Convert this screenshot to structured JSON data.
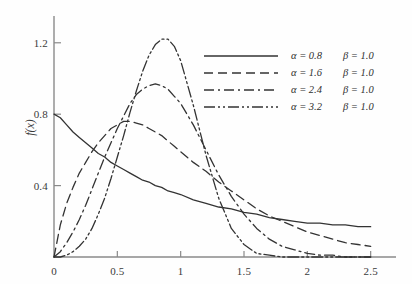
{
  "chart_data": {
    "type": "line",
    "title": "",
    "xlabel": "",
    "ylabel": "f(x)",
    "xlim": [
      0,
      2.7
    ],
    "ylim": [
      0,
      1.35
    ],
    "grid": false,
    "legend_position": "top-right",
    "x_ticks": [
      "0",
      "0.5",
      "1",
      "1.5",
      "2",
      "2.5"
    ],
    "x_tick_values": [
      0,
      0.5,
      1,
      1.5,
      2,
      2.5
    ],
    "y_ticks": [
      "0.4",
      "0.8",
      "1.2"
    ],
    "y_tick_values": [
      0.4,
      0.8,
      1.2
    ],
    "x": [
      0.0,
      0.05,
      0.1,
      0.15,
      0.2,
      0.25,
      0.3,
      0.35,
      0.4,
      0.45,
      0.5,
      0.55,
      0.6,
      0.65,
      0.7,
      0.75,
      0.8,
      0.85,
      0.9,
      0.95,
      1.0,
      1.1,
      1.2,
      1.3,
      1.4,
      1.5,
      1.6,
      1.7,
      1.8,
      1.9,
      2.0,
      2.1,
      2.2,
      2.3,
      2.4,
      2.5
    ],
    "series": [
      {
        "name": "alpha = 0.8, beta = 1.0",
        "alpha": 0.8,
        "beta": 1.0,
        "line_style": "solid",
        "color": "#333333",
        "values": [
          0.8,
          0.78,
          0.74,
          0.7,
          0.67,
          0.64,
          0.61,
          0.58,
          0.56,
          0.53,
          0.51,
          0.49,
          0.47,
          0.45,
          0.43,
          0.42,
          0.4,
          0.39,
          0.37,
          0.36,
          0.35,
          0.32,
          0.3,
          0.28,
          0.27,
          0.25,
          0.24,
          0.22,
          0.21,
          0.2,
          0.19,
          0.19,
          0.18,
          0.18,
          0.17,
          0.17
        ]
      },
      {
        "name": "alpha = 1.6, beta = 1.0",
        "alpha": 1.6,
        "beta": 1.0,
        "line_style": "dashed",
        "color": "#333333",
        "values": [
          0.0,
          0.18,
          0.3,
          0.39,
          0.47,
          0.53,
          0.59,
          0.64,
          0.68,
          0.72,
          0.74,
          0.76,
          0.76,
          0.75,
          0.74,
          0.72,
          0.7,
          0.68,
          0.65,
          0.62,
          0.59,
          0.53,
          0.48,
          0.42,
          0.37,
          0.32,
          0.27,
          0.23,
          0.2,
          0.17,
          0.14,
          0.12,
          0.1,
          0.08,
          0.07,
          0.06
        ]
      },
      {
        "name": "alpha = 2.4, beta = 1.0",
        "alpha": 2.4,
        "beta": 1.0,
        "line_style": "dash-dot",
        "color": "#333333",
        "values": [
          0.0,
          0.03,
          0.08,
          0.14,
          0.21,
          0.29,
          0.38,
          0.47,
          0.56,
          0.64,
          0.72,
          0.79,
          0.86,
          0.91,
          0.94,
          0.96,
          0.97,
          0.96,
          0.94,
          0.9,
          0.86,
          0.74,
          0.6,
          0.46,
          0.34,
          0.24,
          0.16,
          0.1,
          0.06,
          0.04,
          0.02,
          0.01,
          0.01,
          0.0,
          0.0,
          0.0
        ]
      },
      {
        "name": "alpha = 3.2, beta = 1.0",
        "alpha": 3.2,
        "beta": 1.0,
        "line_style": "dash-dot-dot",
        "color": "#333333",
        "values": [
          0.0,
          0.0,
          0.01,
          0.03,
          0.06,
          0.1,
          0.16,
          0.24,
          0.33,
          0.44,
          0.56,
          0.68,
          0.81,
          0.93,
          1.04,
          1.13,
          1.19,
          1.22,
          1.22,
          1.18,
          1.1,
          0.85,
          0.57,
          0.33,
          0.16,
          0.07,
          0.02,
          0.01,
          0.0,
          0.0,
          0.0,
          0.0,
          0.0,
          0.0,
          0.0,
          0.0
        ]
      }
    ],
    "legend_entries": [
      {
        "line_style": "solid",
        "alpha_label": "α = 0.8",
        "beta_label": "β = 1.0"
      },
      {
        "line_style": "dashed",
        "alpha_label": "α = 1.6",
        "beta_label": "β = 1.0"
      },
      {
        "line_style": "dash-dot",
        "alpha_label": "α = 2.4",
        "beta_label": "β = 1.0"
      },
      {
        "line_style": "dash-dot-dot",
        "alpha_label": "α = 3.2",
        "beta_label": "β = 1.0"
      }
    ]
  }
}
